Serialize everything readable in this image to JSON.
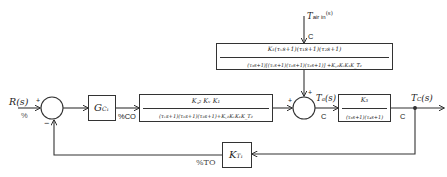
{
  "inputs": {
    "setpoint": {
      "label": "R(s)",
      "unit": "%"
    },
    "disturbance": {
      "label": "T_air in(s)",
      "label_main": "T",
      "label_sub": "air in",
      "label_arg": "(s)",
      "unit": "C"
    }
  },
  "outputs": {
    "controlled": {
      "label": "T_C(s)",
      "unit": "C"
    }
  },
  "signals": {
    "controller_output_unit": "%CO",
    "intermediate": {
      "label": "T_a(s)",
      "unit": "C"
    },
    "transmitter_output_unit": "%TO"
  },
  "summing_junctions": {
    "sj1": {
      "plus": "+",
      "minus": "-"
    },
    "sj2": {
      "plus_left": "+",
      "plus_top": "+"
    }
  },
  "blocks": {
    "controller": {
      "label": "G_C1",
      "main": "G",
      "sub": "C₁"
    },
    "forward_inner": {
      "numerator": "K_C2 K_V K_1",
      "denominator": "(τ_V s+1)(τ_1 s+1)(τ_2 s+1)+K_C2 K_V K_1 K_T2"
    },
    "disturbance_block": {
      "numerator": "K_1(τ_V s+1)(τ_1 s+1)(τ_2 s+1)",
      "denominator": "(τ_3 s+1)[(τ_V s+1)(τ_1 s+1)(τ_2 s+1)]+K_C2 K_V K_1 K_T2"
    },
    "process": {
      "numerator": "K_3",
      "denominator": "(τ_3 s+1)(τ_4 s+1)"
    },
    "transmitter": {
      "label": "K_T1",
      "main": "K",
      "sub": "T₁"
    }
  },
  "display": {
    "sj1_plus": "+",
    "sj1_minus": "−",
    "sj2_plus_left": "+",
    "sj2_plus_top": "+",
    "R_main": "R(s)",
    "pct": "%",
    "Tair_main": "T",
    "Tair_sub": "air in",
    "Tair_arg": "(s)",
    "C": "C",
    "Gc_main": "G",
    "Gc_sub": "C₁",
    "pctCO": "%CO",
    "fwd_num": "K꜀₂ Kᵥ K₁",
    "fwd_den": "(τᵥs+1)(τ₁s+1)(τ₂s+1)+K꜀₂KᵥK₁K_T₂",
    "dist_num": "K₁(τᵥs+1)(τ₁s+1)(τ₂s+1)",
    "dist_den": "(τ₃s+1)[(τᵥs+1)(τ₁s+1)(τ₂s+1)] +K꜀₂KᵥK₁K_T₂",
    "proc_num": "K₃",
    "proc_den": "(τ₃s+1)(τ₄s+1)",
    "Ta_main": "T",
    "Ta_sub": "a",
    "Ta_arg": "(s)",
    "Tc_main": "T",
    "Tc_sub": "C",
    "Tc_arg": "(s)",
    "Kt_main": "K",
    "Kt_sub": "T₁",
    "pctTO": "%TO"
  }
}
